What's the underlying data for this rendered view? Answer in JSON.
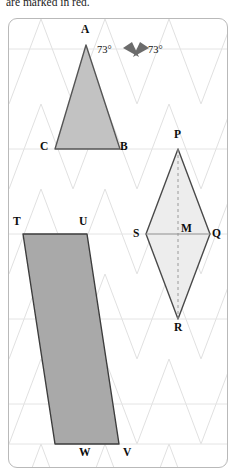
{
  "caption": {
    "text": "are marked in red."
  },
  "figure": {
    "name": "isometric-geometry-figure",
    "background_grid": "isometric-triangular-grid",
    "colors": {
      "grid_line": "#dcdcdc",
      "horizontal_grid_line": "#e2e2e2",
      "frame_border": "#b9b9b9",
      "triangle_fill": "#c2c2c2",
      "triangle_stroke": "#555555",
      "rhombus_fill": "#ededed",
      "rhombus_stroke": "#4a4a4a",
      "parallelogram_fill": "#a9a9a9",
      "parallelogram_stroke": "#3d3d3d",
      "diagonal_dashed": "#8a8a8a",
      "angle_marker_fill": "#6b6b6b",
      "label_text": "#0d0d0d"
    },
    "shapes": [
      {
        "id": "triangle-abc",
        "kind": "triangle",
        "fill": "#c2c2c2",
        "vertices": [
          {
            "label": "A",
            "x": 85,
            "y": 44
          },
          {
            "label": "C",
            "x": 54,
            "y": 148
          },
          {
            "label": "B",
            "x": 119,
            "y": 148
          }
        ]
      },
      {
        "id": "rhombus-pqrs",
        "kind": "rhombus",
        "fill": "#ededed",
        "vertices": [
          {
            "label": "P",
            "x": 177,
            "y": 148
          },
          {
            "label": "Q",
            "x": 209,
            "y": 233
          },
          {
            "label": "R",
            "x": 177,
            "y": 318
          },
          {
            "label": "S",
            "x": 145,
            "y": 233
          }
        ],
        "center": {
          "label": "M",
          "x": 177,
          "y": 233
        },
        "diagonals": [
          {
            "id": "pr-diagonal",
            "style": "dashed",
            "from": "P",
            "to": "R"
          },
          {
            "id": "sq-diagonal",
            "style": "solid",
            "from": "S",
            "to": "Q"
          }
        ]
      },
      {
        "id": "parallelogram-tuvw",
        "kind": "parallelogram",
        "fill": "#a9a9a9",
        "vertices": [
          {
            "label": "T",
            "x": 22,
            "y": 233
          },
          {
            "label": "U",
            "x": 86,
            "y": 233
          },
          {
            "label": "V",
            "x": 118,
            "y": 443
          },
          {
            "label": "W",
            "x": 54,
            "y": 443
          }
        ]
      }
    ],
    "vertex_labels": [
      {
        "name": "vertex-label-a",
        "text": "A",
        "x": 81,
        "y": 24
      },
      {
        "name": "vertex-label-c",
        "text": "C",
        "x": 39,
        "y": 141
      },
      {
        "name": "vertex-label-b",
        "text": "B",
        "x": 119,
        "y": 141
      },
      {
        "name": "vertex-label-p",
        "text": "P",
        "x": 173,
        "y": 128
      },
      {
        "name": "vertex-label-q",
        "text": "Q",
        "x": 210,
        "y": 227
      },
      {
        "name": "vertex-label-m",
        "text": "M",
        "x": 180,
        "y": 222
      },
      {
        "name": "vertex-label-s",
        "text": "S",
        "x": 131,
        "y": 227
      },
      {
        "name": "vertex-label-r",
        "text": "R",
        "x": 173,
        "y": 325
      },
      {
        "name": "vertex-label-t",
        "text": "T",
        "x": 10,
        "y": 220
      },
      {
        "name": "vertex-label-u",
        "text": "U",
        "x": 78,
        "y": 220
      },
      {
        "name": "vertex-label-w",
        "text": "W",
        "x": 78,
        "y": 446
      },
      {
        "name": "vertex-label-v",
        "text": "V",
        "x": 123,
        "y": 446
      }
    ],
    "angle_markers": [
      {
        "name": "angle-marker-left",
        "label": "73°",
        "label_x": 95,
        "label_y": 24,
        "wedge_apex_x": 131,
        "wedge_apex_y": 41
      },
      {
        "name": "angle-marker-right",
        "label": "73°",
        "label_x": 144,
        "label_y": 24,
        "wedge_apex_x": 137,
        "wedge_apex_y": 41
      }
    ]
  }
}
